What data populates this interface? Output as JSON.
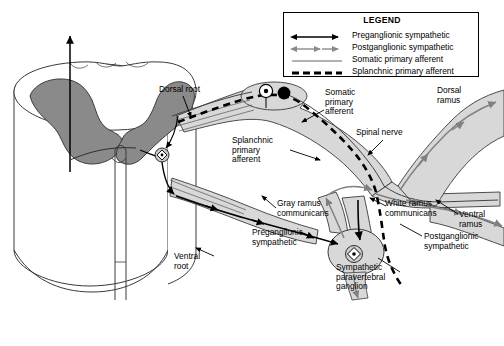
{
  "figure": {
    "background": "#ffffff",
    "colors": {
      "gray_matter": "#8a8a8a",
      "nerve_fill": "#d8d8d8",
      "white_matter": "#ffffff",
      "outline": "#333333",
      "preganglionic": "#000000",
      "postganglionic": "#808080",
      "somatic_afferent": "#555555",
      "splanchnic_afferent": "#000000"
    }
  },
  "legend": {
    "title": "LEGEND",
    "entries": [
      {
        "label": "Preganglionic sympathetic",
        "style": "solid-arrow-black",
        "color": "#000000"
      },
      {
        "label": "Postganglionic sympathetic",
        "style": "solid-arrow-gray",
        "color": "#808080"
      },
      {
        "label": "Somatic primary afferent",
        "style": "thin-solid",
        "color": "#555555"
      },
      {
        "label": "Splanchnic primary afferent",
        "style": "dashed-thick",
        "color": "#000000"
      }
    ]
  },
  "labels": [
    {
      "name": "dorsal-root",
      "text": "Dorsal root",
      "x": 159,
      "y": 85,
      "w": 62,
      "align": "left"
    },
    {
      "name": "somatic-primary-afferent",
      "text": "Somatic\nprimary\nafferent",
      "x": 325,
      "y": 88,
      "w": 54,
      "align": "left"
    },
    {
      "name": "dorsal-ramus",
      "text": "Dorsal\nramus",
      "x": 437,
      "y": 86,
      "w": 44,
      "align": "left"
    },
    {
      "name": "splanchnic-primary-afferent",
      "text": "Splanchnic\nprimary\nafferent",
      "x": 232,
      "y": 136,
      "w": 58,
      "align": "left"
    },
    {
      "name": "spinal-nerve",
      "text": "Spinal nerve",
      "x": 356,
      "y": 128,
      "w": 66,
      "align": "left"
    },
    {
      "name": "gray-ramus-communicans",
      "text": "Gray ramus\ncommunicans",
      "x": 277,
      "y": 199,
      "w": 68,
      "align": "left"
    },
    {
      "name": "white-ramus-communicans",
      "text": "White ramus\ncommunicans",
      "x": 385,
      "y": 199,
      "w": 70,
      "align": "left"
    },
    {
      "name": "ventral-ramus",
      "text": "Ventral\nramus",
      "x": 459,
      "y": 210,
      "w": 44,
      "align": "left"
    },
    {
      "name": "preganglionic-sympathetic",
      "text": "Preganglionic\nsympathetic",
      "x": 252,
      "y": 228,
      "w": 72,
      "align": "left"
    },
    {
      "name": "postganglionic-sympathetic",
      "text": "Postganglionic\nsympathetic",
      "x": 424,
      "y": 232,
      "w": 76,
      "align": "left"
    },
    {
      "name": "ventral-root",
      "text": "Ventral\nroot",
      "x": 174,
      "y": 252,
      "w": 42,
      "align": "left"
    },
    {
      "name": "sympathetic-paravertebral-ganglion",
      "text": "Sympathetic\nparavertebral\nganglion",
      "x": 336,
      "y": 263,
      "w": 72,
      "align": "left"
    }
  ],
  "anatomy": {
    "spinal_cord": {
      "name": "spinal-cord-cylinder",
      "description": "3D cylindrical spinal cord segment with butterfly gray matter on cut surface"
    },
    "markers": [
      {
        "name": "dorsal-root-ganglion-cell-body",
        "shape": "filled-circle",
        "cx": 283,
        "cy": 94,
        "r": 6
      },
      {
        "name": "somatic-afferent-cell-body",
        "shape": "circle-with-dot",
        "cx": 268,
        "cy": 92,
        "r": 6
      },
      {
        "name": "preganglionic-neuron-soma",
        "shape": "diamond-in-circle",
        "cx": 162,
        "cy": 155,
        "r": 6
      },
      {
        "name": "postganglionic-neuron-soma",
        "shape": "diamond-in-circle",
        "cx": 373,
        "cy": 252,
        "r": 7
      }
    ],
    "ascending_tract_arrow": {
      "name": "ascending-tract-arrow",
      "x": 70,
      "y_from": 170,
      "y_to": 32
    }
  }
}
